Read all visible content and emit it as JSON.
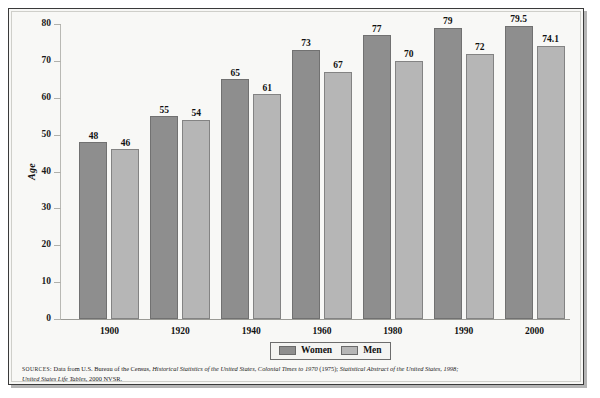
{
  "chart_data": {
    "type": "bar",
    "title": "",
    "xlabel": "",
    "ylabel": "Age",
    "ylim": [
      0,
      80
    ],
    "yticks": [
      0,
      10,
      20,
      30,
      40,
      50,
      60,
      70,
      80
    ],
    "grid": false,
    "legend_position": "bottom-center",
    "categories": [
      "1900",
      "1920",
      "1940",
      "1960",
      "1980",
      "1990",
      "2000"
    ],
    "series": [
      {
        "name": "Women",
        "color": "#8e8e8e",
        "values": [
          48,
          55,
          65,
          73,
          77,
          79,
          79.5
        ],
        "labels": [
          "48",
          "55",
          "65",
          "73",
          "77",
          "79",
          "79.5"
        ]
      },
      {
        "name": "Men",
        "color": "#b6b6b6",
        "values": [
          46,
          54,
          61,
          67,
          70,
          72,
          74.1
        ],
        "labels": [
          "46",
          "54",
          "61",
          "67",
          "70",
          "72",
          "74.1"
        ]
      }
    ]
  },
  "axis": {
    "y_label": "Age",
    "y_ticks": [
      "80",
      "70",
      "60",
      "50",
      "40",
      "30",
      "20",
      "10",
      "0"
    ],
    "x_ticks": [
      "1900",
      "1920",
      "1940",
      "1960",
      "1980",
      "1990",
      "2000"
    ]
  },
  "legend": {
    "items": [
      {
        "label": "Women"
      },
      {
        "label": "Men"
      }
    ]
  },
  "source": {
    "prefix": "sources:",
    "line1_part1": "Data from U.S. Bureau of the Census,",
    "line1_italic": "Historical Statistics of the United States, Colonial Times to 1970",
    "line1_part2": "(1975);",
    "line1_italic2": "Statistical Abstract of the United States, 1998;",
    "line2_italic": "United States Life Tables,",
    "line2_part": "2000 NVSR."
  }
}
